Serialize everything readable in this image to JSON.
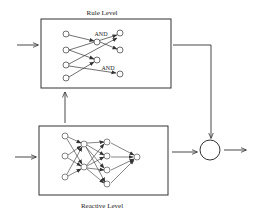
{
  "diagram": {
    "rule_level": {
      "title": "Rule Level",
      "and_labels": [
        "AND",
        "AND"
      ]
    },
    "reactive_level": {
      "title": "Reactive Level"
    },
    "combiner": {
      "shape": "circle"
    },
    "colors": {
      "stroke": "#333333",
      "background": "#ffffff"
    }
  }
}
